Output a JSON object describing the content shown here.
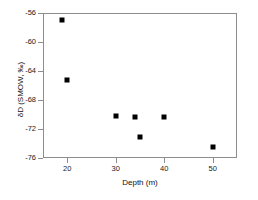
{
  "chart_data": {
    "type": "scatter",
    "title": "",
    "xlabel": "Depth (m)",
    "ylabel": "δD (SMOW, ‰)",
    "xlim": [
      15,
      55
    ],
    "ylim": [
      -76,
      -56
    ],
    "xticks": [
      20,
      30,
      40,
      50
    ],
    "xticklabels": [
      "20",
      "30",
      "40",
      "50"
    ],
    "yticks": [
      -56,
      -60,
      -64,
      -68,
      -72,
      -76
    ],
    "yticklabels": [
      "-56",
      "-60",
      "-64",
      "-68",
      "-72",
      "-76"
    ],
    "grid": false,
    "legend": null,
    "marker": {
      "shape": "square",
      "color": "#000000",
      "size_px": 5
    },
    "series": [
      {
        "name": "δD vs depth",
        "points": [
          {
            "x": 19,
            "y": -56.9
          },
          {
            "x": 20,
            "y": -65.3
          },
          {
            "x": 30,
            "y": -70.2
          },
          {
            "x": 34,
            "y": -70.3
          },
          {
            "x": 35,
            "y": -73.1
          },
          {
            "x": 40,
            "y": -70.3
          },
          {
            "x": 50,
            "y": -74.5
          }
        ]
      }
    ]
  },
  "axes": {
    "frame_color": "#8d8d8d",
    "tick_color": "#8d8d8d",
    "text_color": "#1a1a1a"
  }
}
